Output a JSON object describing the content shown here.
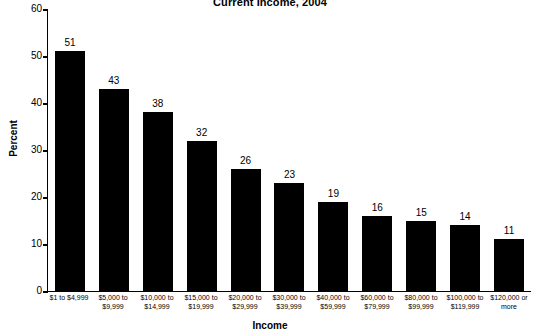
{
  "chart_data": {
    "type": "bar",
    "title": "Current Income, 2004",
    "xlabel": "Income",
    "ylabel": "Percent",
    "ylim": [
      0,
      60
    ],
    "yticks": [
      0,
      10,
      20,
      30,
      40,
      50,
      60
    ],
    "grid": false,
    "legend": "none",
    "categories": [
      "$1 to $4,999",
      "$5,000 to\n$9,999",
      "$10,000 to\n$14,999",
      "$15,000 to\n$19,999",
      "$20,000 to\n$29,999",
      "$30,000 to\n$39,999",
      "$40,000 to\n$59,999",
      "$60,000 to\n$79,999",
      "$80,000 to\n$99,999",
      "$100,000 to\n$119,999",
      "$120,000 or\nmore"
    ],
    "category_lines": [
      [
        "$1 to $4,999",
        ""
      ],
      [
        "$5,000 to",
        "$9,999"
      ],
      [
        "$10,000 to",
        "$14,999"
      ],
      [
        "$15,000 to",
        "$19,999"
      ],
      [
        "$20,000 to",
        "$29,999"
      ],
      [
        "$30,000 to",
        "$39,999"
      ],
      [
        "$40,000 to",
        "$59,999"
      ],
      [
        "$60,000 to",
        "$79,999"
      ],
      [
        "$80,000 to",
        "$99,999"
      ],
      [
        "$100,000 to",
        "$119,999"
      ],
      [
        "$120,000 or",
        "more"
      ]
    ],
    "values": [
      51,
      43,
      38,
      32,
      26,
      23,
      19,
      16,
      15,
      14,
      11
    ],
    "bar_color": "#000000",
    "axis_color": "#000000",
    "background": "#ffffff"
  }
}
